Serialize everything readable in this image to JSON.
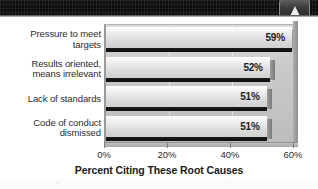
{
  "header": {
    "band_name": "dark-textured-band",
    "badge_icon": "cone-triangle-icon"
  },
  "chart_data": {
    "type": "bar",
    "orientation": "horizontal",
    "title": "",
    "xlabel": "Percent Citing These Root Causes",
    "ylabel": "",
    "categories": [
      "Pressure to meet targets",
      "Results oriented, means irrelevant",
      "Lack of standards",
      "Code of conduct dismissed"
    ],
    "category_lines": [
      [
        "Pressure to meet",
        "targets"
      ],
      [
        "Results oriented,",
        "means irrelevant"
      ],
      [
        "Lack of standards"
      ],
      [
        "Code of conduct",
        "dismissed"
      ]
    ],
    "values": [
      59,
      52,
      51,
      51
    ],
    "value_labels": [
      "59%",
      "52%",
      "51%",
      "51%"
    ],
    "xlim": [
      0,
      60
    ],
    "xticks": [
      0,
      20,
      40,
      60
    ],
    "xticklabels": [
      "0%",
      "20%",
      "40%",
      "60%"
    ],
    "grid": true,
    "legend": null,
    "style": "3d-grayscale",
    "colors": {
      "bar_face": "#ececec",
      "bar_depth": "#141414",
      "plot_background": "#cdcdcd",
      "axis": "#8f8f8f",
      "text": "#2b2b2b"
    }
  }
}
